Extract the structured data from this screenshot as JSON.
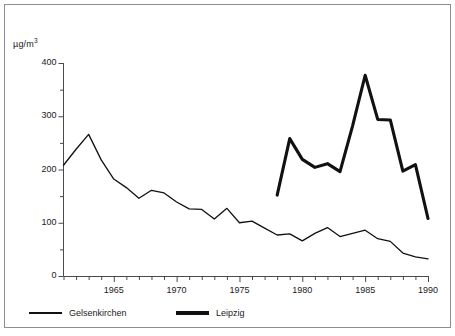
{
  "figure": {
    "background_color": "#ffffff",
    "frame_color": "#8d8d8d",
    "ink_color": "#111111"
  },
  "axis": {
    "y_unit_label": "µg/m",
    "y_unit_exponent": "3",
    "y_ticks": [
      "0",
      "100",
      "200",
      "300",
      "400"
    ],
    "x_ticks": [
      "1965",
      "1970",
      "1975",
      "1980",
      "1985",
      "1990"
    ]
  },
  "legend": {
    "items": [
      {
        "label": "Gelsenkirchen",
        "style": "thin"
      },
      {
        "label": "Leipzig",
        "style": "thick"
      }
    ]
  },
  "chart_data": {
    "type": "line",
    "title": "",
    "subtitle": "",
    "xlabel": "",
    "ylabel": "µg/m³",
    "xlim": [
      1961,
      1990
    ],
    "ylim": [
      0,
      400
    ],
    "y_major_ticks": [
      0,
      100,
      200,
      300,
      400
    ],
    "y_minor_tick_interval": 50,
    "x_labeled_ticks": [
      1965,
      1970,
      1975,
      1980,
      1985,
      1990
    ],
    "x_tick_interval": 1,
    "grid": false,
    "legend_position": "below-plot-left",
    "annotations": [],
    "series": [
      {
        "name": "Gelsenkirchen",
        "line_style": "thin",
        "color": "#111111",
        "x": [
          1961,
          1962,
          1963,
          1964,
          1965,
          1966,
          1967,
          1968,
          1969,
          1970,
          1971,
          1972,
          1973,
          1974,
          1975,
          1976,
          1977,
          1978,
          1979,
          1980,
          1981,
          1982,
          1983,
          1984,
          1985,
          1986,
          1987,
          1988,
          1989,
          1990
        ],
        "values": [
          208,
          238,
          266,
          218,
          182,
          166,
          146,
          161,
          156,
          139,
          126,
          125,
          107,
          127,
          100,
          103,
          90,
          77,
          79,
          66,
          80,
          91,
          74,
          80,
          86,
          70,
          65,
          43,
          36,
          32
        ]
      },
      {
        "name": "Leipzig",
        "line_style": "thick",
        "color": "#111111",
        "x": [
          1978,
          1979,
          1980,
          1981,
          1982,
          1983,
          1984,
          1985,
          1986,
          1987,
          1988,
          1989,
          1990
        ],
        "values": [
          152,
          258,
          219,
          204,
          211,
          196,
          282,
          377,
          294,
          293,
          197,
          209,
          108
        ]
      }
    ]
  }
}
